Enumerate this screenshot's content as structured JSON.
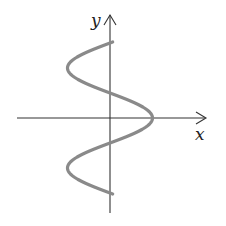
{
  "diagram": {
    "type": "function-graph",
    "axes": {
      "x_label": "x",
      "y_label": "y",
      "axis_color": "#333333"
    },
    "curve": {
      "color": "#8a8a8a",
      "stroke_width": 3.2,
      "center_x_px": 110,
      "amplitude_px": 42.5,
      "period_px": 100,
      "peak_y_px": 118,
      "y_start_px": 42,
      "y_end_px": 194
    }
  }
}
